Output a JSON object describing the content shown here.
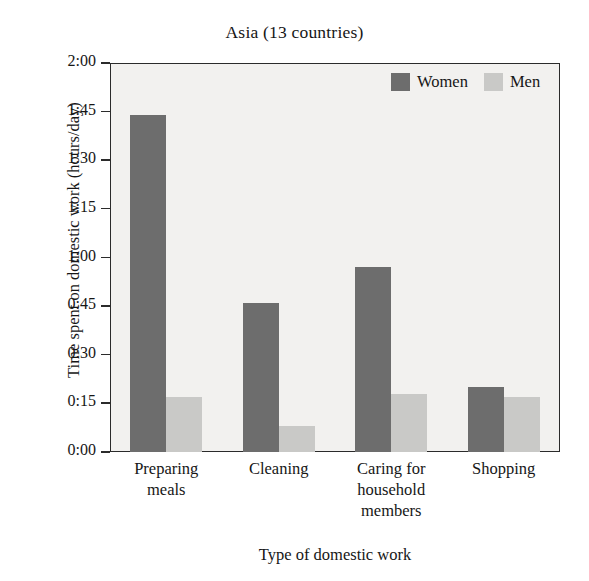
{
  "chart_data": {
    "type": "bar",
    "title": "Asia (13 countries)",
    "xlabel": "Type of domestic work",
    "ylabel": "Time spent on domestic work (hours/day)",
    "categories": [
      "Preparing meals",
      "Cleaning",
      "Caring for household members",
      "Shopping"
    ],
    "category_lines": [
      [
        "Preparing",
        "meals"
      ],
      [
        "Cleaning"
      ],
      [
        "Caring for",
        "household",
        "members"
      ],
      [
        "Shopping"
      ]
    ],
    "series": [
      {
        "name": "Women",
        "color": "#6d6d6d",
        "values": [
          1.733,
          0.767,
          0.95,
          0.333
        ],
        "value_labels": [
          "1:44",
          "0:46",
          "0:57",
          "0:20"
        ]
      },
      {
        "name": "Men",
        "color": "#c9c9c7",
        "values": [
          0.283,
          0.133,
          0.3,
          0.283
        ],
        "value_labels": [
          "0:17",
          "0:08",
          "0:18",
          "0:17"
        ]
      }
    ],
    "ylim": [
      0,
      2
    ],
    "ytick_values": [
      2,
      1.75,
      1.5,
      1.25,
      1,
      0.75,
      0.5,
      0.25,
      0
    ],
    "ytick_labels": [
      "2:00",
      "1:45",
      "1:30",
      "1:15",
      "1:00",
      "0:45",
      "0:30",
      "0:15",
      "0:00"
    ],
    "grid": false,
    "legend_position": "top-right",
    "plot_background": "#f2f1ef",
    "axis_color": "#2b2b2b"
  },
  "legend": {
    "entries": [
      {
        "label": "Women"
      },
      {
        "label": "Men"
      }
    ]
  }
}
